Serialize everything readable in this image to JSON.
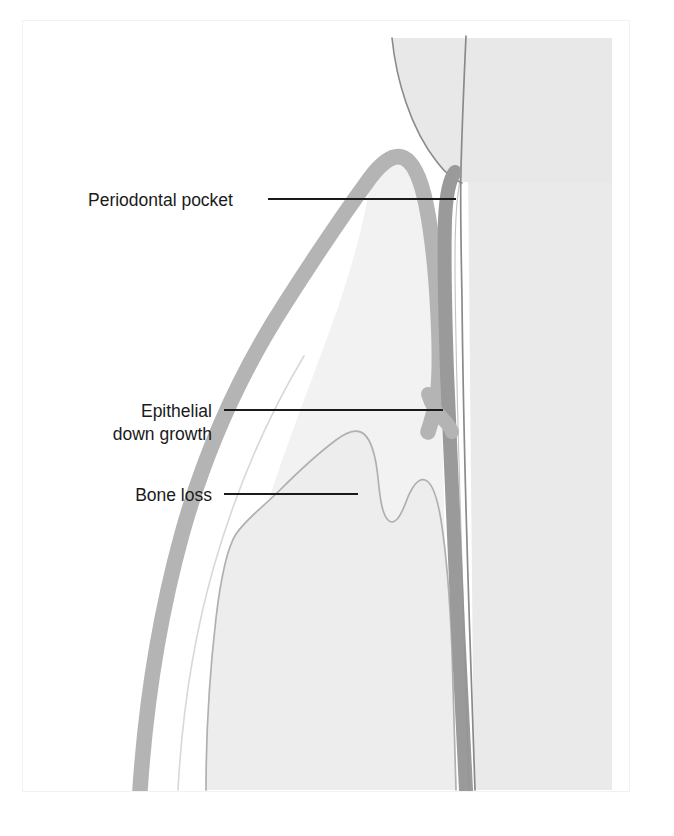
{
  "figure": {
    "type": "dental-anatomy-illustration",
    "view": "sagittal cross-section of tooth, gingiva and alveolar bone",
    "background_color": "#ffffff",
    "caption": ""
  },
  "palette": {
    "background": "#ffffff",
    "tooth_fill": "#e8e8e8",
    "tooth_outline": "#8d8d8d",
    "gingiva_band": "#b4b4b4",
    "pocket_band": "#9a9a9a",
    "bone_fill": "#ededed",
    "bone_outline": "#a9a9a9",
    "soft_tissue_fill": "#f1f1f1",
    "leader_line": "#1a1a1a",
    "label_text": "#1a1a1a",
    "page_frame": "#f2f2f2"
  },
  "labels": [
    {
      "id": "periodontal-pocket",
      "text": "Periodontal pocket",
      "text_x": 88,
      "text_y": 199,
      "anchor": "start",
      "font_size": 17.5,
      "leader": {
        "x1": 268,
        "y1": 199,
        "x2": 456,
        "y2": 199
      }
    },
    {
      "id": "epithelial-down-growth",
      "text_lines": [
        "Epithelial",
        "down growth"
      ],
      "text_x": 212,
      "text_y": 413,
      "line_height": 23,
      "anchor": "end",
      "font_size": 17.5,
      "leader": {
        "x1": 224,
        "y1": 410,
        "x2": 443,
        "y2": 410
      }
    },
    {
      "id": "bone-loss",
      "text": "Bone loss",
      "text_x": 212,
      "text_y": 498,
      "anchor": "end",
      "font_size": 17.5,
      "leader": {
        "x1": 224,
        "y1": 494,
        "x2": 358,
        "y2": 494
      }
    }
  ],
  "structures": [
    {
      "id": "tooth-crown",
      "name": "tooth crown (enamel)",
      "color": "#e8e8e8"
    },
    {
      "id": "tooth-root",
      "name": "tooth root",
      "color": "#e9e9e9"
    },
    {
      "id": "root-canal-line",
      "name": "root canal / pulp outline",
      "color": "#8d8d8d"
    },
    {
      "id": "gingiva-margin",
      "name": "gingival margin band",
      "color": "#b4b4b4"
    },
    {
      "id": "periodontal-pocket-band",
      "name": "periodontal pocket lining",
      "color": "#9a9a9a"
    },
    {
      "id": "alveolar-bone",
      "name": "alveolar bone crest with resorption",
      "color": "#ededed"
    },
    {
      "id": "interdental-papilla",
      "name": "interdental papilla soft tissue",
      "color": "#f1f1f1"
    }
  ]
}
